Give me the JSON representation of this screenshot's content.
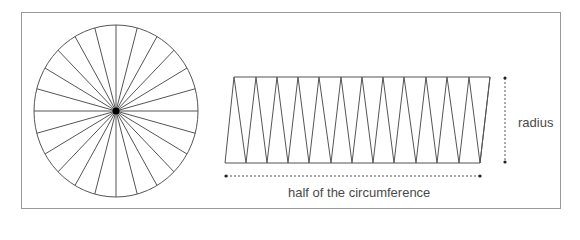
{
  "diagram": {
    "circle": {
      "sector_count": 24,
      "center": [
        116,
        111
      ],
      "rx": 82,
      "ry": 86
    },
    "rearranged": {
      "top_points_x": [
        234,
        256,
        277,
        298,
        319,
        341,
        362,
        383,
        404,
        426,
        447,
        469,
        490
      ],
      "bottom_points_x": [
        225,
        246,
        267,
        288,
        309,
        331,
        352,
        373,
        394,
        416,
        437,
        459,
        480
      ],
      "top_y": 77,
      "bottom_y": 163
    },
    "labels": {
      "radius": "radius",
      "half_circumference": "half of the circumference"
    },
    "colors": {
      "line": "#555555",
      "frame": "#9a9a9a",
      "text": "#4a4a4a",
      "center_dot": "#000000"
    }
  }
}
